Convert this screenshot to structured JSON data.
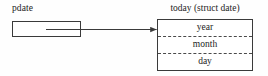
{
  "diagram": {
    "type": "pointer-to-struct",
    "background_color": "#fefefe",
    "line_color": "#3a3a3a",
    "text_color": "#1c1c1c",
    "pointer": {
      "label": "pdate",
      "box_value": "",
      "name": "pdate"
    },
    "connector": {
      "style": "solid-line-with-arrowhead",
      "from": "pdate box interior",
      "to": "today struct box left edge",
      "arrowhead": "filled-triangle"
    },
    "struct": {
      "title": "today (struct date)",
      "variable_name": "today",
      "type_name": "struct date",
      "separator_style": "dashed",
      "fields": [
        {
          "label": "year"
        },
        {
          "label": "month"
        },
        {
          "label": "day"
        }
      ]
    }
  }
}
